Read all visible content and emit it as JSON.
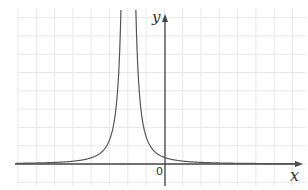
{
  "chart_data": {
    "type": "line",
    "title": "",
    "xlabel": "x",
    "ylabel": "y",
    "origin_label": "0",
    "grid": true,
    "grid_color": "#e8e8e8",
    "axis_color": "#444444",
    "curve_color": "#555555",
    "function": "y = k / (x + 2)^2",
    "vertical_asymptote": -2,
    "horizontal_asymptote": 0,
    "k": 1.4,
    "xlim": [
      -8.3,
      7.5
    ],
    "ylim": [
      -1.4,
      9
    ],
    "series": [
      {
        "name": "curve",
        "x": [
          -8,
          -6,
          -5,
          -4,
          -3,
          -2.6,
          -2.4,
          -1.6,
          -1.4,
          -1,
          0,
          1,
          2,
          4,
          7
        ],
        "y": [
          0.04,
          0.09,
          0.16,
          0.35,
          1.4,
          3.9,
          8.75,
          8.75,
          3.9,
          1.4,
          0.35,
          0.16,
          0.09,
          0.04,
          0.02
        ]
      }
    ]
  }
}
